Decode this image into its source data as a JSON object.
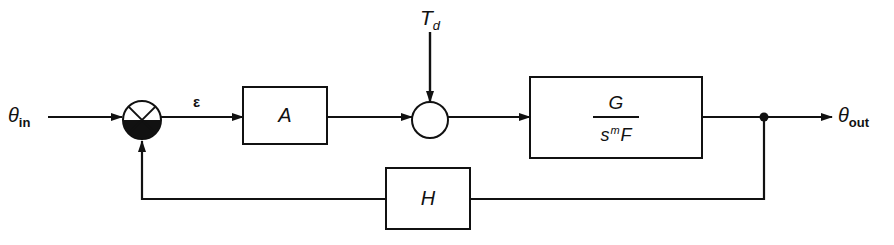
{
  "diagram": {
    "type": "feedback control block diagram",
    "input": {
      "symbol": "θ",
      "subscript": "in"
    },
    "output": {
      "symbol": "θ",
      "subscript": "out"
    },
    "error_signal": {
      "symbol": "ε"
    },
    "disturbance": {
      "symbol": "T",
      "subscript": "d"
    },
    "blocks": {
      "amplifier": {
        "label": "A"
      },
      "plant": {
        "numerator": "G",
        "denominator_base": "s",
        "denominator_exponent": "m",
        "denominator_tail": "F"
      },
      "feedback": {
        "label": "H"
      }
    },
    "junctions": {
      "comparator": {
        "type": "summing junction",
        "shaded_lower_half": true
      },
      "disturbance_sum": {
        "type": "summing junction"
      },
      "takeoff_point": {
        "type": "branch dot"
      }
    },
    "colors": {
      "line": "#111111",
      "background": "#ffffff"
    }
  }
}
